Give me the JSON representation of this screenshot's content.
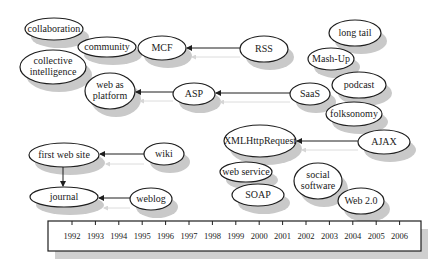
{
  "diagram": {
    "type": "Web 2.0 concept evolution timeline",
    "nodes": [
      {
        "id": "collaboration",
        "lines": [
          "collaboration"
        ],
        "cx": 54,
        "cy": 29,
        "rx": 29,
        "ry": 11
      },
      {
        "id": "community",
        "lines": [
          "community"
        ],
        "cx": 107,
        "cy": 47,
        "rx": 29,
        "ry": 10
      },
      {
        "id": "mcf",
        "lines": [
          "MCF"
        ],
        "cx": 162,
        "cy": 48,
        "rx": 24,
        "ry": 12
      },
      {
        "id": "rss",
        "lines": [
          "RSS"
        ],
        "cx": 264,
        "cy": 49,
        "rx": 24,
        "ry": 13
      },
      {
        "id": "collective-intelligence",
        "lines": [
          "collective",
          "intelligence"
        ],
        "cx": 53,
        "cy": 67,
        "rx": 33,
        "ry": 17
      },
      {
        "id": "web-as-platform",
        "lines": [
          "web as",
          "platform"
        ],
        "cx": 110,
        "cy": 91,
        "rx": 25,
        "ry": 18
      },
      {
        "id": "asp",
        "lines": [
          "ASP"
        ],
        "cx": 194,
        "cy": 94,
        "rx": 21,
        "ry": 11
      },
      {
        "id": "saas",
        "lines": [
          "SaaS"
        ],
        "cx": 310,
        "cy": 94,
        "rx": 20,
        "ry": 11
      },
      {
        "id": "long-tail",
        "lines": [
          "long tail"
        ],
        "cx": 355,
        "cy": 33,
        "rx": 26,
        "ry": 13
      },
      {
        "id": "mash-up",
        "lines": [
          "Mash-Up"
        ],
        "cx": 331,
        "cy": 59,
        "rx": 23,
        "ry": 11
      },
      {
        "id": "podcast",
        "lines": [
          "podcast"
        ],
        "cx": 359,
        "cy": 85,
        "rx": 27,
        "ry": 13
      },
      {
        "id": "folksonomy",
        "lines": [
          "folksonomy"
        ],
        "cx": 354,
        "cy": 114,
        "rx": 28,
        "ry": 12
      },
      {
        "id": "xmlhttprequest",
        "lines": [
          "XMLHttpRequest"
        ],
        "cx": 260,
        "cy": 141,
        "rx": 36,
        "ry": 16
      },
      {
        "id": "ajax",
        "lines": [
          "AJAX"
        ],
        "cx": 384,
        "cy": 142,
        "rx": 26,
        "ry": 12
      },
      {
        "id": "first-web-site",
        "lines": [
          "first web site"
        ],
        "cx": 64,
        "cy": 155,
        "rx": 35,
        "ry": 12
      },
      {
        "id": "wiki",
        "lines": [
          "wiki"
        ],
        "cx": 164,
        "cy": 154,
        "rx": 20,
        "ry": 11
      },
      {
        "id": "journal",
        "lines": [
          "journal"
        ],
        "cx": 64,
        "cy": 197,
        "rx": 34,
        "ry": 10
      },
      {
        "id": "weblog",
        "lines": [
          "weblog"
        ],
        "cx": 151,
        "cy": 199,
        "rx": 21,
        "ry": 11
      },
      {
        "id": "web-service",
        "lines": [
          "web service"
        ],
        "cx": 246,
        "cy": 172,
        "rx": 26,
        "ry": 10
      },
      {
        "id": "soap",
        "lines": [
          "SOAP"
        ],
        "cx": 258,
        "cy": 195,
        "rx": 26,
        "ry": 11
      },
      {
        "id": "social-software",
        "lines": [
          "social",
          "software"
        ],
        "cx": 318,
        "cy": 181,
        "rx": 24,
        "ry": 18
      },
      {
        "id": "web-2-0",
        "lines": [
          "Web 2.0"
        ],
        "cx": 361,
        "cy": 201,
        "rx": 23,
        "ry": 13
      }
    ],
    "edges": [
      {
        "from": "rss",
        "to": "mcf",
        "x1": 240,
        "y1": 48,
        "x2": 187,
        "y2": 48
      },
      {
        "from": "saas",
        "to": "asp",
        "x1": 290,
        "y1": 93,
        "x2": 216,
        "y2": 93
      },
      {
        "from": "asp",
        "to": "web-as-platform",
        "x1": 173,
        "y1": 92,
        "x2": 136,
        "y2": 92
      },
      {
        "from": "ajax",
        "to": "xmlhttprequest",
        "x1": 358,
        "y1": 141,
        "x2": 297,
        "y2": 141
      },
      {
        "from": "wiki",
        "to": "first-web-site",
        "x1": 144,
        "y1": 154,
        "x2": 100,
        "y2": 154
      },
      {
        "from": "weblog",
        "to": "journal",
        "x1": 130,
        "y1": 198,
        "x2": 99,
        "y2": 198
      },
      {
        "from": "first-web-site",
        "to": "journal",
        "x1": 63,
        "y1": 167,
        "x2": 63,
        "y2": 186
      }
    ],
    "ghost_edges": [
      {
        "x1": 240,
        "y1": 57,
        "x2": 192,
        "y2": 57
      },
      {
        "x1": 290,
        "y1": 102,
        "x2": 220,
        "y2": 102
      },
      {
        "x1": 173,
        "y1": 101,
        "x2": 140,
        "y2": 101
      },
      {
        "x1": 358,
        "y1": 150,
        "x2": 302,
        "y2": 150
      },
      {
        "x1": 144,
        "y1": 164,
        "x2": 106,
        "y2": 164
      },
      {
        "x1": 130,
        "y1": 208,
        "x2": 104,
        "y2": 208
      }
    ],
    "timeline": {
      "x": 48,
      "y": 221,
      "width": 373,
      "height": 30,
      "years": [
        "1992",
        "1993",
        "1994",
        "1995",
        "1996",
        "1997",
        "1998",
        "1999",
        "2000",
        "2001",
        "2002",
        "2003",
        "2004",
        "2005",
        "2006"
      ],
      "first_tick_x": 72,
      "tick_spacing": 23.4
    },
    "colors": {
      "stroke": "#1e1e1e",
      "fill": "#ffffff",
      "shadow": "#c9c9c9",
      "ghost_arrow": "#dcdcdc"
    }
  }
}
